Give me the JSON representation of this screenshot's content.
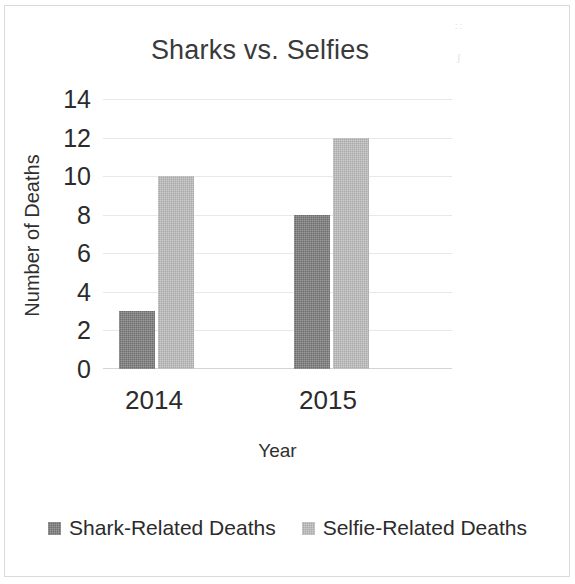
{
  "chart_data": {
    "type": "bar",
    "title": "Sharks vs. Selfies",
    "xlabel": "Year",
    "ylabel": "Number of Deaths",
    "categories": [
      "2014",
      "2015"
    ],
    "series": [
      {
        "name": "Shark-Related Deaths",
        "values": [
          3,
          8
        ],
        "color": "#6e6e6e"
      },
      {
        "name": "Selfie-Related Deaths",
        "values": [
          10,
          12
        ],
        "color": "#a9a9a9"
      }
    ],
    "ylim": [
      0,
      14
    ],
    "ytick_labels": [
      "14",
      "12",
      "10",
      "8",
      "6",
      "4",
      "2",
      "0"
    ],
    "ytick_values": [
      14,
      12,
      10,
      8,
      6,
      4,
      2,
      0
    ],
    "grid": true,
    "grid_axis": "y",
    "legend_position": "bottom",
    "bar_grouping": "clustered"
  },
  "figure": {
    "background_color": "#ffffff",
    "border_color": "#dadada",
    "text_color": "#2b2b2b",
    "gridline_color": "#e8e8e8",
    "speck_glyph_1": "∷",
    "speck_glyph_2": "ʃ"
  }
}
